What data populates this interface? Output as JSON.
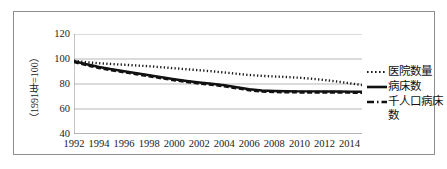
{
  "chart_data": {
    "type": "line",
    "title": "",
    "xlabel": "",
    "ylabel": "（1991年=100）",
    "ylim": [
      40,
      120
    ],
    "yticks": [
      40,
      60,
      80,
      100,
      120
    ],
    "xlim": [
      1992,
      2015
    ],
    "xticks": [
      1992,
      1994,
      1996,
      1998,
      2000,
      2002,
      2004,
      2006,
      2008,
      2010,
      2012,
      2014
    ],
    "grid": "horizontal",
    "legend_position": "right",
    "x": [
      1992,
      1993,
      1994,
      1995,
      1996,
      1997,
      1998,
      1999,
      2000,
      2001,
      2002,
      2003,
      2004,
      2005,
      2006,
      2007,
      2008,
      2009,
      2010,
      2011,
      2012,
      2013,
      2014,
      2015
    ],
    "series": [
      {
        "name": "医院数量",
        "style": "dotted",
        "color": "#1a1a1a",
        "values": [
          98.6,
          97.4,
          96.6,
          96.0,
          95.4,
          94.8,
          94.2,
          93.4,
          92.6,
          91.8,
          91.0,
          90.2,
          89.2,
          88.2,
          87.2,
          86.5,
          86.0,
          85.6,
          85.0,
          84.2,
          83.2,
          82.0,
          80.6,
          79.2
        ]
      },
      {
        "name": "病床数",
        "style": "solid",
        "color": "#111111",
        "values": [
          98.2,
          95.8,
          93.6,
          91.8,
          90.2,
          88.6,
          87.0,
          85.4,
          83.8,
          82.4,
          81.2,
          80.2,
          79.0,
          77.4,
          75.8,
          74.8,
          74.4,
          74.2,
          74.1,
          74.1,
          74.0,
          74.0,
          73.9,
          73.8
        ]
      },
      {
        "name": "千人口病床数",
        "style": "dashed",
        "color": "#111111",
        "values": [
          97.8,
          95.2,
          93.0,
          91.2,
          89.6,
          88.0,
          86.4,
          84.8,
          83.2,
          81.8,
          80.6,
          79.6,
          78.4,
          76.8,
          75.2,
          74.2,
          73.8,
          73.6,
          73.5,
          73.5,
          73.4,
          73.4,
          73.3,
          73.2
        ]
      }
    ]
  },
  "axis": {
    "y_tick_labels": [
      "120",
      "100",
      "80",
      "60",
      "40"
    ],
    "y_axis_title": "（1991年=100）",
    "x_tick_labels": [
      "1992",
      "1994",
      "1996",
      "1998",
      "2000",
      "2002",
      "2004",
      "2006",
      "2008",
      "2010",
      "2012",
      "2014"
    ]
  },
  "legend": {
    "items": [
      {
        "label": "医院数量",
        "style": "dotted"
      },
      {
        "label": "病床数",
        "style": "solid"
      },
      {
        "label": "千人口病床数",
        "style": "dashed"
      }
    ]
  }
}
